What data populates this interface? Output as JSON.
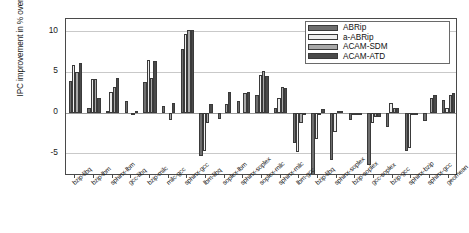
{
  "chart_data": {
    "type": "bar",
    "title": "",
    "xlabel": "",
    "ylabel": "IPC improvement in % over SRRIP",
    "ylim": [
      -7.8,
      11.5
    ],
    "yticks": [
      10,
      5,
      0,
      -5
    ],
    "grid": true,
    "legend_position": "top-right",
    "categories": [
      "bzip-libq",
      "bzip-lbm",
      "sphinx-lbm",
      "gcc-libq",
      "bzip-milc",
      "milc-gcc",
      "sphinx-gcc",
      "lbm-libq",
      "soplex-lbm",
      "sphinx-soplex",
      "soplex-milc",
      "sphinx-milc",
      "lbm-gcc",
      "bzip-libq",
      "sphinx-soplex",
      "bzip-soplex",
      "gcc-soplex",
      "bzip-gcc",
      "sphinx-bzip",
      "sphinx-gcc",
      "geomean"
    ],
    "series": [
      {
        "name": "ABRip",
        "color": "#6e6e6e",
        "values": [
          3.9,
          0.6,
          0.2,
          1.4,
          3.8,
          0.8,
          7.8,
          -5.4,
          -0.8,
          1.4,
          2.2,
          0.5,
          -3.7,
          -7.8,
          -5.8,
          -0.9,
          -6.4,
          -1.8,
          -4.7,
          -1.0,
          1.6
        ]
      },
      {
        "name": "a-ABRip",
        "color": "#ededed",
        "values": [
          5.9,
          4.1,
          2.5,
          0.0,
          6.5,
          0.0,
          9.6,
          -4.7,
          0.0,
          0.0,
          4.6,
          1.8,
          -4.9,
          -3.2,
          -2.4,
          -0.2,
          -1.3,
          1.2,
          -4.3,
          0.0,
          0.6
        ]
      },
      {
        "name": "ACAM-SDM",
        "color": "#a8a8a8",
        "values": [
          5.0,
          4.1,
          3.2,
          -0.3,
          4.3,
          -0.9,
          10.1,
          -1.3,
          1.1,
          2.4,
          5.1,
          3.2,
          -1.3,
          -0.1,
          0.2,
          -0.1,
          -0.5,
          0.5,
          -0.3,
          1.8,
          2.2
        ]
      },
      {
        "name": "ACAM-ATD",
        "color": "#4a4a4a",
        "values": [
          6.1,
          1.8,
          4.3,
          0.2,
          6.3,
          1.2,
          10.1,
          1.0,
          2.5,
          2.5,
          4.5,
          3.0,
          -0.2,
          0.4,
          0.2,
          -0.05,
          -0.5,
          0.5,
          -0.2,
          2.2,
          2.4
        ]
      }
    ]
  },
  "legend": {
    "items": [
      {
        "label": "ABRip"
      },
      {
        "label": "a-ABRip"
      },
      {
        "label": "ACAM-SDM"
      },
      {
        "label": "ACAM-ATD"
      }
    ]
  }
}
